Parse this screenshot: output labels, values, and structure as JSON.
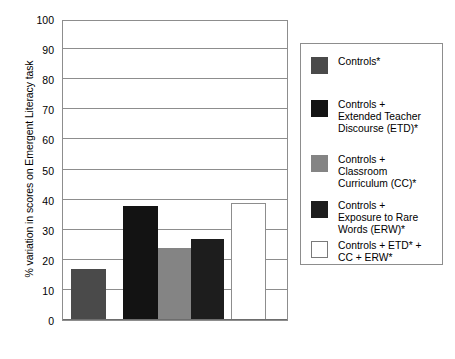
{
  "chart_data": {
    "type": "bar",
    "title": "",
    "xlabel": "",
    "ylabel": "% variation in scores on Emergent Literacy task",
    "ylim": [
      0,
      100
    ],
    "yticks": [
      0,
      10,
      20,
      30,
      40,
      50,
      60,
      70,
      80,
      90,
      100
    ],
    "grid": true,
    "legend_position": "right",
    "categories": [
      "Controls*",
      "Controls + Extended Teacher Discourse (ETD)*",
      "Controls + Classroom Curriculum (CC)*",
      "Controls + Exposure to Rare Words (ERW)*",
      "Controls + ETD* + CC + ERW*"
    ],
    "values": [
      17,
      38,
      24,
      27,
      39
    ],
    "colors": [
      "#4a4a4a",
      "#131313",
      "#848484",
      "#1d1d1d",
      "#ffffff"
    ]
  },
  "legend": {
    "items": [
      {
        "label": "Controls*",
        "color": "#4a4a4a",
        "outlined": false
      },
      {
        "label": "Controls +\nExtended Teacher\nDiscourse (ETD)*",
        "color": "#131313",
        "outlined": false
      },
      {
        "label": "Controls +\nClassroom\nCurriculum (CC)*",
        "color": "#848484",
        "outlined": false
      },
      {
        "label": "Controls +\nExposure to Rare\nWords (ERW)*",
        "color": "#1d1d1d",
        "outlined": false
      },
      {
        "label": "Controls + ETD* +\nCC + ERW*",
        "color": "#ffffff",
        "outlined": true
      }
    ]
  },
  "axis": {
    "y_title": "% variation in scores on Emergent Literacy task",
    "tick_labels": [
      "100",
      "90",
      "80",
      "70",
      "60",
      "50",
      "40",
      "30",
      "20",
      "10",
      "0"
    ]
  }
}
